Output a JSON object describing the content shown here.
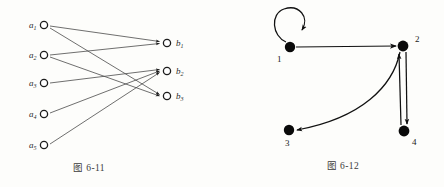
{
  "page": {
    "background": "#fdfdfb",
    "ink": "#2b2b2b"
  },
  "figures": [
    {
      "id": "figure-6-11",
      "caption": "图 6-11",
      "type": "bipartite-digraph",
      "description": "Bipartite directed graph from set A to set B",
      "left_nodes": [
        {
          "id": "a1",
          "label": "a",
          "sub": "1",
          "cx": 44,
          "cy": 25
        },
        {
          "id": "a2",
          "label": "a",
          "sub": "2",
          "cx": 44,
          "cy": 55
        },
        {
          "id": "a3",
          "label": "a",
          "sub": "3",
          "cx": 44,
          "cy": 83
        },
        {
          "id": "a4",
          "label": "a",
          "sub": "4",
          "cx": 44,
          "cy": 114
        },
        {
          "id": "a5",
          "label": "a",
          "sub": "5",
          "cx": 44,
          "cy": 145
        }
      ],
      "right_nodes": [
        {
          "id": "b1",
          "label": "b",
          "sub": "1",
          "cx": 167,
          "cy": 43
        },
        {
          "id": "b2",
          "label": "b",
          "sub": "2",
          "cx": 167,
          "cy": 71
        },
        {
          "id": "b3",
          "label": "b",
          "sub": "3",
          "cx": 167,
          "cy": 96
        }
      ],
      "edges": [
        {
          "from": "a1",
          "to": "b1"
        },
        {
          "from": "a1",
          "to": "b3"
        },
        {
          "from": "a2",
          "to": "b1"
        },
        {
          "from": "a2",
          "to": "b3"
        },
        {
          "from": "a3",
          "to": "b2"
        },
        {
          "from": "a4",
          "to": "b2"
        },
        {
          "from": "a5",
          "to": "b2"
        }
      ]
    },
    {
      "id": "figure-6-12",
      "caption": "图 6-12",
      "type": "digraph",
      "description": "Directed graph on four vertices with a self-loop",
      "nodes": [
        {
          "id": "n1",
          "label": "1",
          "cx": 68,
          "cy": 47
        },
        {
          "id": "n2",
          "label": "2",
          "cx": 181,
          "cy": 46
        },
        {
          "id": "n3",
          "label": "3",
          "cx": 67,
          "cy": 130
        },
        {
          "id": "n4",
          "label": "4",
          "cx": 182,
          "cy": 131
        }
      ],
      "edges": [
        {
          "from": "n1",
          "to": "n1",
          "kind": "self-loop"
        },
        {
          "from": "n1",
          "to": "n2",
          "kind": "straight"
        },
        {
          "from": "n2",
          "to": "n3",
          "kind": "curved"
        },
        {
          "from": "n2",
          "to": "n4",
          "kind": "straight"
        },
        {
          "from": "n4",
          "to": "n2",
          "kind": "straight"
        }
      ]
    }
  ]
}
